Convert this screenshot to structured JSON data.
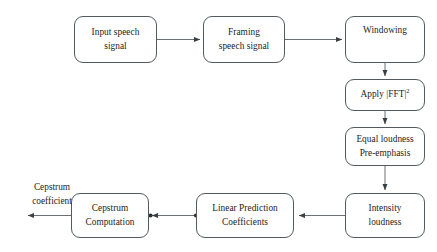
{
  "diagram": {
    "background_color": "#ffffff",
    "stroke_color": "#555a5e",
    "text_color": "#1c1c1c",
    "nodes": [
      {
        "id": "input-speech-signal",
        "label": "Input speech\nsignal",
        "shape": "rounded-rectangle",
        "x": 74,
        "y": 16,
        "w": 83,
        "h": 47
      },
      {
        "id": "framing-speech-signal",
        "label": "Framing\nspeech signal",
        "shape": "rounded-rectangle",
        "x": 203,
        "y": 16,
        "w": 82,
        "h": 47
      },
      {
        "id": "windowing",
        "label": "Windowing",
        "shape": "rounded-rectangle",
        "x": 345,
        "y": 16,
        "w": 80,
        "h": 47
      },
      {
        "id": "apply-fft-squared",
        "label": "Apply |FFT|",
        "superscript": "2",
        "shape": "rounded-rectangle",
        "x": 345,
        "y": 79,
        "w": 80,
        "h": 32
      },
      {
        "id": "equal-loudness-preemphasis",
        "label": "Equal loudness\nPre-emphasis",
        "shape": "rounded-rectangle",
        "x": 345,
        "y": 127,
        "w": 80,
        "h": 39
      },
      {
        "id": "intensity-loudness",
        "label": "Intensity\nloudness",
        "shape": "rounded-rectangle",
        "x": 345,
        "y": 193,
        "w": 80,
        "h": 45
      },
      {
        "id": "linear-prediction-coefficients",
        "label": "Linear Prediction\nCoefficients",
        "shape": "rounded-rectangle",
        "x": 196,
        "y": 193,
        "w": 98,
        "h": 45
      },
      {
        "id": "cepstrum-computation",
        "label": "Cepstrum\nComputation",
        "shape": "rounded-rectangle",
        "x": 71,
        "y": 193,
        "w": 78,
        "h": 45
      }
    ],
    "free_labels": [
      {
        "id": "cepstrum-coefficient-label",
        "text": "Cepstrum\ncoefficient",
        "x": 12,
        "y": 168,
        "w": 80
      }
    ],
    "edges": [
      {
        "id": "edge-input-to-framing",
        "from": "input-speech-signal",
        "to": "framing-speech-signal",
        "direction": "right"
      },
      {
        "id": "edge-framing-to-windowing",
        "from": "framing-speech-signal",
        "to": "windowing",
        "direction": "right"
      },
      {
        "id": "edge-windowing-to-fft",
        "from": "windowing",
        "to": "apply-fft-squared",
        "direction": "down"
      },
      {
        "id": "edge-fft-to-equal-loudness",
        "from": "apply-fft-squared",
        "to": "equal-loudness-preemphasis",
        "direction": "down"
      },
      {
        "id": "edge-equal-loudness-to-intensity",
        "from": "equal-loudness-preemphasis",
        "to": "intensity-loudness",
        "direction": "down"
      },
      {
        "id": "edge-intensity-to-lpc",
        "from": "intensity-loudness",
        "to": "linear-prediction-coefficients",
        "direction": "left"
      },
      {
        "id": "edge-lpc-to-cepstrum",
        "from": "linear-prediction-coefficients",
        "to": "cepstrum-computation",
        "direction": "left"
      },
      {
        "id": "edge-cepstrum-to-output",
        "from": "cepstrum-computation",
        "to": "cepstrum-coefficient-label",
        "direction": "left"
      }
    ]
  }
}
